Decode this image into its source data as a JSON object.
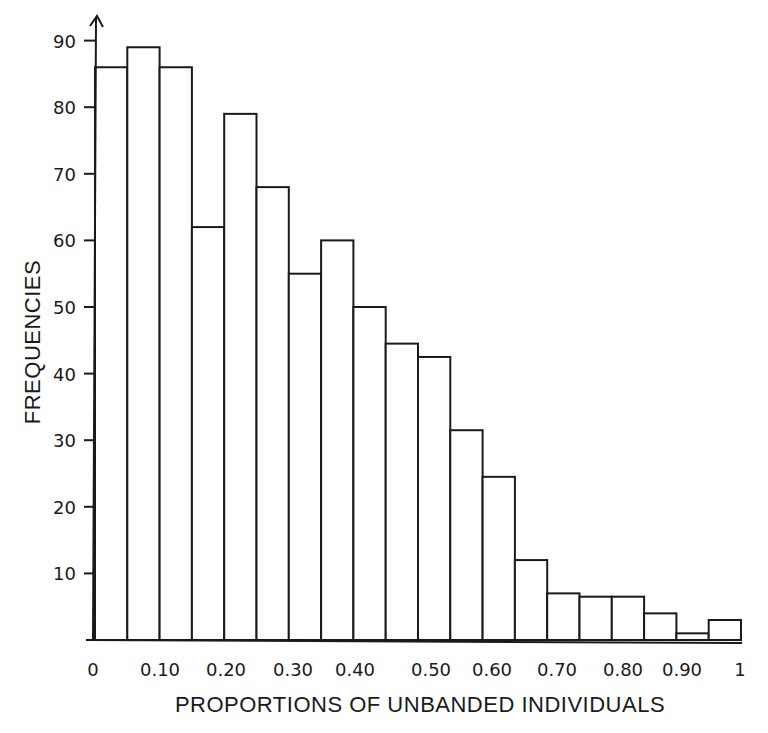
{
  "chart_data": {
    "type": "bar",
    "title": "",
    "xlabel": "PROPORTIONS OF UNBANDED INDIVIDUALS",
    "ylabel": "FREQUENCIES",
    "ylim": [
      0,
      92
    ],
    "xlim": [
      0,
      1
    ],
    "grid": false,
    "legend": null,
    "bin_width": 0.05,
    "bin_edges": [
      0,
      0.05,
      0.1,
      0.15,
      0.2,
      0.25,
      0.3,
      0.35,
      0.4,
      0.45,
      0.5,
      0.55,
      0.6,
      0.65,
      0.7,
      0.75,
      0.8,
      0.85,
      0.9,
      0.95,
      1.0
    ],
    "categories": [
      "0-0.05",
      "0.05-0.10",
      "0.10-0.15",
      "0.15-0.20",
      "0.20-0.25",
      "0.25-0.30",
      "0.30-0.35",
      "0.35-0.40",
      "0.40-0.45",
      "0.45-0.50",
      "0.50-0.55",
      "0.55-0.60",
      "0.60-0.65",
      "0.65-0.70",
      "0.70-0.75",
      "0.75-0.80",
      "0.80-0.85",
      "0.85-0.90",
      "0.90-0.95",
      "0.95-1.0"
    ],
    "values": [
      86,
      89,
      86,
      62,
      79,
      68,
      55,
      60,
      50,
      44.5,
      42.5,
      31.5,
      24.5,
      12,
      7,
      6.5,
      6.5,
      4,
      1,
      3
    ],
    "y_ticks": [
      10,
      20,
      30,
      40,
      50,
      60,
      70,
      80,
      90
    ],
    "x_ticks": [
      "0",
      "0.10",
      "0.20",
      "0.30",
      "0.40",
      "0.50",
      "0.60",
      "0.70",
      "0.80",
      "0.90",
      "1"
    ]
  }
}
